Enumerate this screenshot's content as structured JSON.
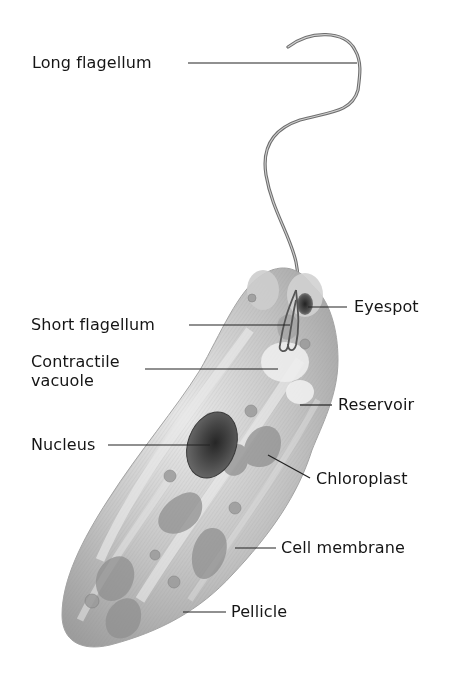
{
  "figure": {
    "caption_partially_visible": true
  },
  "labels": {
    "long_flagellum": "Long flagellum",
    "eyespot": "Eyespot",
    "short_flagellum": "Short flagellum",
    "contractile_vacuole_line1": "Contractile",
    "contractile_vacuole_line2": "vacuole",
    "reservoir": "Reservoir",
    "nucleus": "Nucleus",
    "chloroplast": "Chloroplast",
    "cell_membrane": "Cell membrane",
    "pellicle": "Pellicle"
  },
  "colors": {
    "background": "#ffffff",
    "label_text": "#151515",
    "leader_line": "#222222",
    "cell_body": "#b9b9b9",
    "cell_highlight": "#e6e6e6",
    "nucleus": "#4a4a4a",
    "eyespot": "#3d3d3d",
    "flagellum": "#7a7a7a"
  }
}
